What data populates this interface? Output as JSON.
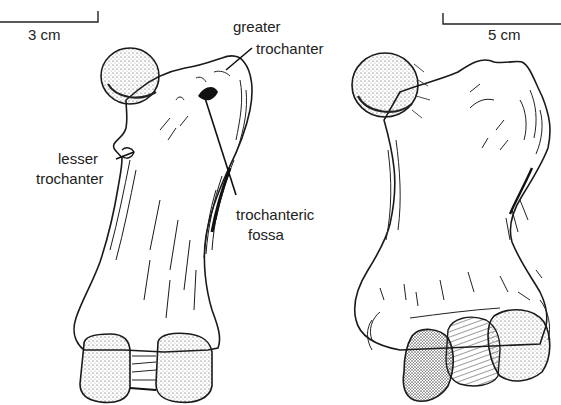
{
  "figure": {
    "left_specimen": {
      "scale_bar": {
        "label": "3 cm"
      },
      "annotations": [
        {
          "id": "greater-trochanter",
          "line1": "greater",
          "line2": "trochanter"
        },
        {
          "id": "lesser-trochanter",
          "line1": "lesser",
          "line2": "trochanter"
        },
        {
          "id": "trochanteric-fossa",
          "line1": "trochanteric",
          "line2": "fossa"
        }
      ]
    },
    "right_specimen": {
      "scale_bar": {
        "label": "5 cm"
      }
    },
    "colors": {
      "ink": "#1a1a1a",
      "paper": "#ffffff"
    }
  }
}
